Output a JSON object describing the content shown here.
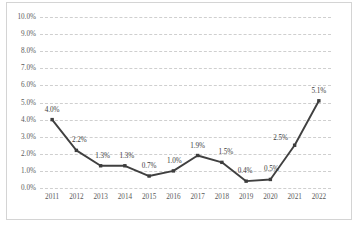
{
  "chart_data": {
    "type": "line",
    "title": "",
    "subtitle": "",
    "xlabel": "",
    "ylabel": "",
    "categories": [
      "2011",
      "2012",
      "2013",
      "2014",
      "2015",
      "2016",
      "2017",
      "2018",
      "2019",
      "2020",
      "2021",
      "2022"
    ],
    "values": [
      4.0,
      2.2,
      1.3,
      1.3,
      0.7,
      1.0,
      1.9,
      1.5,
      0.4,
      0.5,
      2.5,
      5.1
    ],
    "data_labels": [
      "4.0%",
      "2.2%",
      "1.3%",
      "1.3%",
      "0.7%",
      "1.0%",
      "1.9%",
      "1.5%",
      "0.4%",
      "0.5%",
      "2.5%",
      "5.1%"
    ],
    "ylim": [
      0.0,
      10.0
    ],
    "ytick_values": [
      0.0,
      1.0,
      2.0,
      3.0,
      4.0,
      5.0,
      6.0,
      7.0,
      8.0,
      9.0,
      10.0
    ],
    "ytick_labels": [
      "0.0%",
      "1.0%",
      "2.0%",
      "3.0%",
      "4.0%",
      "5.0%",
      "6.0%",
      "7.0%",
      "8.0%",
      "9.0%",
      "10.0%"
    ],
    "grid": true,
    "grid_style": "dashed",
    "grid_color": "#cfcfcf",
    "legend": false,
    "legend_position": "none",
    "series": [
      {
        "name": "",
        "values": [
          4.0,
          2.2,
          1.3,
          1.3,
          0.7,
          1.0,
          1.9,
          1.5,
          0.4,
          0.5,
          2.5,
          5.1
        ],
        "line_color": "#404040",
        "marker": "square",
        "marker_color": "#3d3d3d"
      }
    ],
    "label_offsets": [
      {
        "dx": 0,
        "dy": -6
      },
      {
        "dx": 3,
        "dy": -6
      },
      {
        "dx": 2,
        "dy": -6
      },
      {
        "dx": 2,
        "dy": -6
      },
      {
        "dx": 0,
        "dy": -6
      },
      {
        "dx": 1,
        "dy": -6
      },
      {
        "dx": 0,
        "dy": -6
      },
      {
        "dx": 4,
        "dy": -6
      },
      {
        "dx": -1,
        "dy": -6
      },
      {
        "dx": 1,
        "dy": -6
      },
      {
        "dx": -14,
        "dy": -3
      },
      {
        "dx": 0,
        "dy": -6
      }
    ],
    "frame_color": "#d4d4d4",
    "background_color": "#ffffff"
  }
}
